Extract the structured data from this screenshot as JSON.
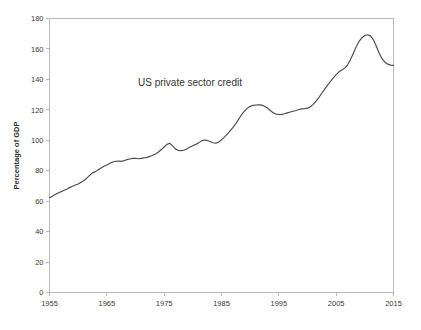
{
  "chart_data": {
    "type": "line",
    "title": "",
    "annotation": "US private sector credit",
    "xlabel": "",
    "ylabel": "Percentage of GDP",
    "xlim": [
      1955,
      2015
    ],
    "ylim": [
      0,
      180
    ],
    "grid": false,
    "legend_position": "none",
    "x_ticks": [
      1955,
      1965,
      1975,
      1985,
      1995,
      2005,
      2015
    ],
    "y_ticks": [
      0,
      20,
      40,
      60,
      80,
      100,
      120,
      140,
      160,
      180
    ],
    "line_color": "#4a4a4a",
    "frame_color": "#b9b9b9",
    "background_color": "#ffffff",
    "series": [
      {
        "name": "US private sector credit",
        "x": [
          1955,
          1955.5,
          1956,
          1956.5,
          1957,
          1957.5,
          1958,
          1958.5,
          1959,
          1959.5,
          1960,
          1960.5,
          1961,
          1961.5,
          1962,
          1962.5,
          1963,
          1963.5,
          1964,
          1964.5,
          1965,
          1965.5,
          1966,
          1966.5,
          1967,
          1967.5,
          1968,
          1968.5,
          1969,
          1969.5,
          1970,
          1970.5,
          1971,
          1971.5,
          1972,
          1972.5,
          1973,
          1973.5,
          1974,
          1974.5,
          1975,
          1975.5,
          1976,
          1976.5,
          1977,
          1977.5,
          1978,
          1978.5,
          1979,
          1979.5,
          1980,
          1980.5,
          1981,
          1981.5,
          1982,
          1982.5,
          1983,
          1983.5,
          1984,
          1984.5,
          1985,
          1985.5,
          1986,
          1986.5,
          1987,
          1987.5,
          1988,
          1988.5,
          1989,
          1989.5,
          1990,
          1990.5,
          1991,
          1991.5,
          1992,
          1992.5,
          1993,
          1993.5,
          1994,
          1994.5,
          1995,
          1995.5,
          1996,
          1996.5,
          1997,
          1997.5,
          1998,
          1998.5,
          1999,
          1999.5,
          2000,
          2000.5,
          2001,
          2001.5,
          2002,
          2002.5,
          2003,
          2003.5,
          2004,
          2004.5,
          2005,
          2005.5,
          2006,
          2006.5,
          2007,
          2007.5,
          2008,
          2008.5,
          2009,
          2009.5,
          2010,
          2010.5,
          2011,
          2011.5,
          2012,
          2012.5,
          2013,
          2013.5,
          2014,
          2014.5,
          2015
        ],
        "values": [
          62.2,
          63.3,
          64.4,
          65.3,
          66.2,
          67.0,
          67.8,
          68.9,
          69.8,
          70.6,
          71.3,
          72.4,
          73.6,
          75.1,
          76.9,
          78.6,
          79.4,
          80.6,
          81.8,
          82.9,
          83.8,
          84.8,
          85.7,
          86.2,
          86.4,
          86.1,
          86.6,
          87.3,
          87.7,
          88.1,
          88.2,
          87.9,
          88.1,
          88.4,
          88.8,
          89.4,
          90.2,
          91.0,
          92.3,
          93.9,
          95.6,
          97.3,
          98.0,
          96.1,
          94.2,
          93.3,
          93.2,
          93.6,
          94.5,
          95.6,
          96.4,
          97.3,
          98.3,
          99.6,
          100.2,
          99.9,
          99.2,
          98.4,
          98.1,
          98.8,
          100.3,
          102.1,
          104.0,
          106.2,
          108.5,
          110.9,
          113.9,
          116.8,
          119.2,
          121.1,
          122.3,
          122.9,
          123.2,
          123.3,
          123.1,
          122.4,
          121.2,
          119.6,
          118.1,
          117.2,
          116.9,
          117.0,
          117.4,
          118.0,
          118.6,
          119.1,
          119.6,
          120.2,
          120.6,
          120.8,
          121.1,
          122.0,
          123.6,
          125.7,
          128.2,
          130.9,
          133.6,
          136.2,
          138.6,
          141.0,
          143.1,
          145.0,
          146.2,
          147.4,
          149.6,
          153.0,
          157.2,
          161.5,
          165.0,
          167.4,
          168.8,
          169.3,
          168.6,
          166.0,
          161.8,
          157.4,
          153.6,
          151.3,
          150.0,
          149.4,
          149.2
        ]
      }
    ],
    "key_points": [
      {
        "label": "series start",
        "x": 1955,
        "y": 62.2
      },
      {
        "label": "mid-1960s plateau",
        "x": 1967,
        "y": 86.4
      },
      {
        "label": "1974 local peak",
        "x": 1974.5,
        "y": 98.0
      },
      {
        "label": "1976 trough",
        "x": 1976.5,
        "y": 93.2
      },
      {
        "label": "1982 local peak",
        "x": 1982,
        "y": 100.2
      },
      {
        "label": "1990 plateau",
        "x": 1991.5,
        "y": 123.3
      },
      {
        "label": "mid-1990s trough",
        "x": 1995,
        "y": 116.9
      },
      {
        "label": "2008 peak",
        "x": 2008.5,
        "y": 169.3
      },
      {
        "label": "series end",
        "x": 2015,
        "y": 149.2
      }
    ]
  }
}
